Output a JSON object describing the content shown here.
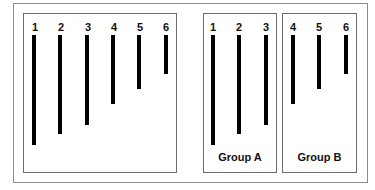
{
  "diagram": {
    "panels": [
      {
        "name": "all-bars",
        "label": "",
        "bars": [
          {
            "label": "1",
            "length": 110
          },
          {
            "label": "2",
            "length": 99
          },
          {
            "label": "3",
            "length": 90
          },
          {
            "label": "4",
            "length": 69
          },
          {
            "label": "5",
            "length": 54
          },
          {
            "label": "6",
            "length": 39
          }
        ]
      },
      {
        "name": "group-a",
        "label": "Group A",
        "bars": [
          {
            "label": "1",
            "length": 110
          },
          {
            "label": "2",
            "length": 99
          },
          {
            "label": "3",
            "length": 90
          }
        ]
      },
      {
        "name": "group-b",
        "label": "Group B",
        "bars": [
          {
            "label": "4",
            "length": 69
          },
          {
            "label": "5",
            "length": 54
          },
          {
            "label": "6",
            "length": 39
          }
        ]
      }
    ]
  }
}
